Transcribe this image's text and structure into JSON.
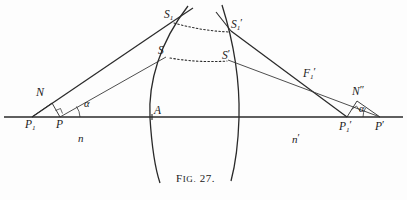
{
  "figure": {
    "caption_prefix": "F",
    "caption_small": "IG.",
    "caption_number": "27.",
    "caption_full": "FIG. 27.",
    "ink_color": "#1a1a1a",
    "paper_color": "#fdfdfd"
  },
  "labels": {
    "object_point_axial": "P",
    "object_point_sub": "P1",
    "nodal_object": "N",
    "angle_object": "α",
    "medium_object": "n",
    "vertex": "A",
    "source_upper": "S1",
    "source_lower": "S",
    "image_upper": "S1'",
    "image_lower": "S'",
    "focal_image": "F1'",
    "nodal_image": "N''",
    "image_point_sub": "P1'",
    "image_point_axial": "P'",
    "angle_image": "α",
    "medium_image": "n'"
  },
  "label_text": {
    "P": "P",
    "P1_base": "P",
    "P1_sub": "1",
    "N": "N",
    "alpha_left": "α",
    "n": "n",
    "A": "A",
    "S1_base": "S",
    "S1_sub": "1",
    "S": "S",
    "S1p_base": "S",
    "S1p_sub": "1",
    "S1p_prime": "′",
    "Sp_base": "S",
    "Sp_prime": "′",
    "F1p_base": "F",
    "F1p_sub": "1",
    "F1p_prime": "′",
    "Npp_base": "N",
    "Npp_prime": "″",
    "P1p_base": "P",
    "P1p_sub": "1",
    "P1p_prime": "′",
    "Pp_base": "P",
    "Pp_prime": "′",
    "alpha_right": "α",
    "np_base": "n",
    "np_prime": "′"
  },
  "geometry": {
    "axis": {
      "x1": 4,
      "y1": 117,
      "x2": 403,
      "y2": 117
    },
    "points": {
      "P1": {
        "x": 32,
        "y": 117
      },
      "P": {
        "x": 60,
        "y": 117
      },
      "N": {
        "x": 52,
        "y": 104
      },
      "A": {
        "x": 153,
        "y": 117
      },
      "S1": {
        "x": 172,
        "y": 22
      },
      "S": {
        "x": 166,
        "y": 57
      },
      "S1p": {
        "x": 231,
        "y": 31
      },
      "Sp": {
        "x": 228,
        "y": 60
      },
      "F1p": {
        "x": 305,
        "y": 80
      },
      "Npp": {
        "x": 357,
        "y": 102
      },
      "P1p": {
        "x": 347,
        "y": 117
      },
      "Pp": {
        "x": 380,
        "y": 117
      }
    },
    "surface_front": {
      "top_x": 188,
      "top_y": 6,
      "vertex_x": 150,
      "bottom_x": 160,
      "bottom_y": 182
    },
    "surface_back": {
      "top_x": 222,
      "top_y": 5,
      "mid_x": 240,
      "bottom_x": 231,
      "bottom_y": 180
    }
  }
}
